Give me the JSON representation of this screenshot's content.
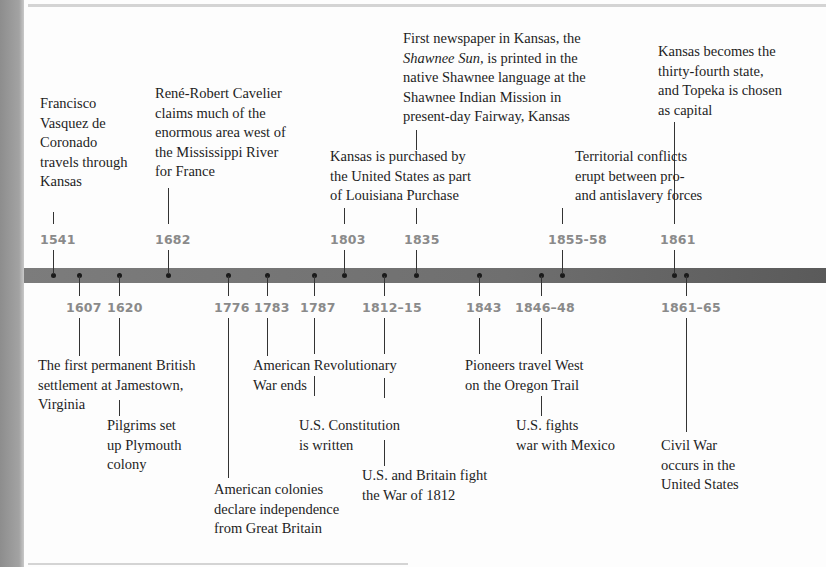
{
  "colors": {
    "bar": "#6f6f6f",
    "year_label": "#8a8a8a",
    "text": "#1e1e1e",
    "dot": "#1a1a1a"
  },
  "above": [
    {
      "year": "1541",
      "text": "Francisco Vasquez de Coronado travels through Kansas"
    },
    {
      "year": "1682",
      "text": "René-Robert Cavelier claims much of the enormous area west of the Mississippi River for France"
    },
    {
      "year": "1803",
      "text": "Kansas is purchased by the United States as part of Louisiana Purchase"
    },
    {
      "year": "1835",
      "text_italic": "Shawnee Sun,",
      "text_pre": "First newspaper in Kansas, the",
      "text_post": "is printed in the native Shawnee language at the Shawnee Indian Mission in present-day Fairway, Kansas"
    },
    {
      "year": "1855-58",
      "text": "Territorial conflicts erupt between pro- and antislavery forces"
    },
    {
      "year": "1861",
      "text": "Kansas becomes the thirty-fourth state, and Topeka is chosen as capital"
    }
  ],
  "below": [
    {
      "year": "1607",
      "text": "The first permanent British settlement at Jamestown, Virginia"
    },
    {
      "year": "1620",
      "text": "Pilgrims set up Plymouth colony"
    },
    {
      "year": "1776",
      "text": "American colonies declare independence from Great Britain"
    },
    {
      "year": "1783",
      "text": "American Revolutionary War ends"
    },
    {
      "year": "1787",
      "text": "U.S. Constitution is written"
    },
    {
      "year": "1812–15",
      "text": "U.S. and Britain fight the War of 1812"
    },
    {
      "year": "1843",
      "text": "Pioneers travel West on the Oregon Trail"
    },
    {
      "year": "1846–48",
      "text": "U.S. fights war with Mexico"
    },
    {
      "year": "1861–65",
      "text": "Civil War occurs in the United States"
    }
  ],
  "lines": {
    "a1541": [
      "Francisco",
      "Vasquez de",
      "Coronado",
      "travels through",
      "Kansas"
    ],
    "a1682": [
      "René-Robert Cavelier",
      "claims much of the",
      "enormous area west of",
      "the Mississippi River",
      "for France"
    ],
    "a1803": [
      "Kansas is purchased by",
      "the United States as part",
      "of Louisiana Purchase"
    ],
    "a1835_l1": "First newspaper in Kansas, the",
    "a1835_l2_italic": "Shawnee Sun,",
    "a1835_l2_rest": " is printed in the",
    "a1835_rest": [
      "native Shawnee language at the",
      "Shawnee Indian Mission in",
      "present-day Fairway, Kansas"
    ],
    "a1855": [
      "Territorial conflicts",
      "erupt between pro-",
      "and antislavery forces"
    ],
    "a1861": [
      "Kansas becomes the",
      "thirty-fourth state,",
      "and Topeka is chosen",
      "as capital"
    ],
    "b1607": [
      "The first permanent British",
      "settlement at Jamestown,",
      "Virginia"
    ],
    "b1620": [
      "Pilgrims set",
      "up Plymouth",
      "colony"
    ],
    "b1776": [
      "American colonies",
      "declare independence",
      "from Great Britain"
    ],
    "b1783": [
      "American Revolutionary",
      "War ends"
    ],
    "b1787": [
      "U.S. Constitution",
      "is written"
    ],
    "b1812": [
      "U.S. and Britain fight",
      "the War of 1812"
    ],
    "b1843": [
      "Pioneers travel West",
      "on the Oregon Trail"
    ],
    "b1846": [
      "U.S. fights",
      "war with Mexico"
    ],
    "b1861": [
      "Civil War",
      "occurs in the",
      "United States"
    ]
  }
}
